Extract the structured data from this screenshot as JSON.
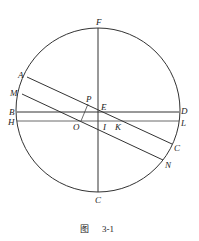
{
  "figure": {
    "caption_prefix": "图",
    "caption_number": "3-1",
    "labels": {
      "F": "F",
      "A": "A",
      "M": "M",
      "B": "B",
      "H": "H",
      "P": "P",
      "E": "E",
      "O": "O",
      "I": "I",
      "K": "K",
      "D": "D",
      "L": "L",
      "C_right": "C",
      "N": "N",
      "C_bottom": "C"
    },
    "colors": {
      "stroke": "#333333",
      "text": "#222222",
      "background": "#ffffff"
    }
  }
}
